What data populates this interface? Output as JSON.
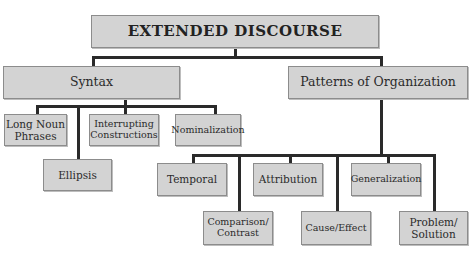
{
  "diagram": {
    "type": "hierarchy",
    "root": {
      "label": "EXTENDED DISCOURSE"
    },
    "branches": [
      {
        "label": "Syntax",
        "children": [
          {
            "label": "Long Noun\nPhrases"
          },
          {
            "label": "Ellipsis"
          },
          {
            "label": "Interrupting\nConstructions"
          },
          {
            "label": "Nominalization"
          }
        ]
      },
      {
        "label": "Patterns of Organization",
        "children": [
          {
            "label": "Temporal"
          },
          {
            "label": "Comparison/\nContrast"
          },
          {
            "label": "Attribution"
          },
          {
            "label": "Cause/Effect"
          },
          {
            "label": "Generalization"
          },
          {
            "label": "Problem/\nSolution"
          }
        ]
      }
    ]
  },
  "colors": {
    "box_fill": "#d3d3d3",
    "box_border": "#8c8c8c",
    "connector": "#2a2a2a",
    "text": "#2b2b2b",
    "background": "#ffffff"
  }
}
